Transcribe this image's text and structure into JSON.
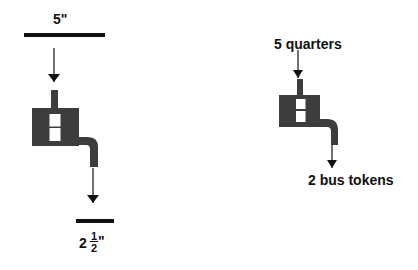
{
  "diagram": {
    "left": {
      "input_label": "5\"",
      "output_whole": "2",
      "output_numerator": "1",
      "output_denominator": "2",
      "output_unit": "\""
    },
    "right": {
      "input_label": "5 quarters",
      "output_label": "2 bus tokens"
    },
    "colors": {
      "machine": "#3d3d3d",
      "line": "#111111",
      "window": "#ffffff"
    }
  }
}
